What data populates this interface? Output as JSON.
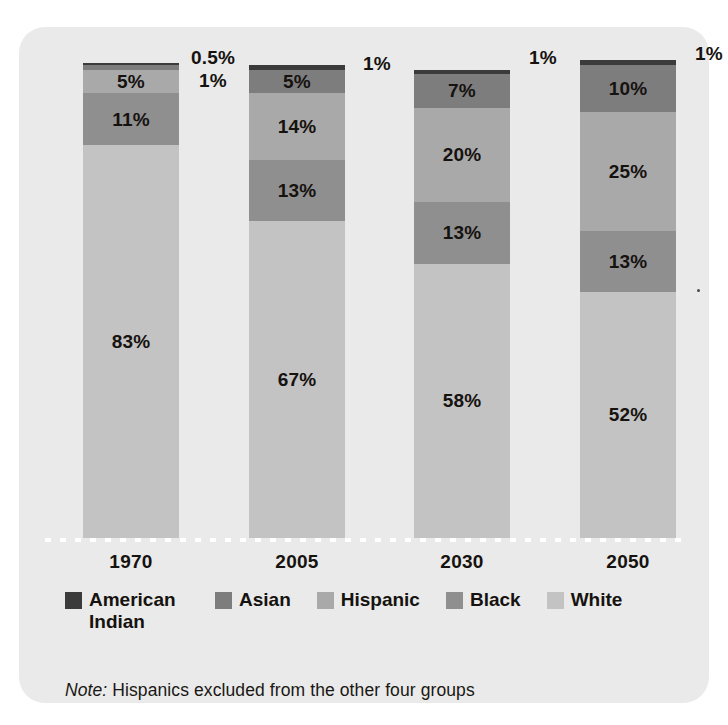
{
  "card": {
    "background": "#e9eae9"
  },
  "chart_data": {
    "type": "bar",
    "stacked": true,
    "title": "",
    "subtitle": "",
    "xlabel": "",
    "ylabel": "",
    "ylim": [
      0,
      100
    ],
    "grid": false,
    "legend_position": "bottom",
    "categories": [
      "1970",
      "2005",
      "2030",
      "2050"
    ],
    "series": [
      {
        "name": "American Indian",
        "color": "#3b3b3b",
        "values": [
          0.5,
          1,
          1,
          1
        ],
        "labels": [
          "0.5%",
          "1%",
          "1%",
          "1%"
        ],
        "label_placement": "outside-right"
      },
      {
        "name": "Asian",
        "color": "#7d7d7d",
        "values": [
          1,
          5,
          7,
          10
        ],
        "labels": [
          "1%",
          "5%",
          "7%",
          "10%"
        ],
        "label_placement": "inside"
      },
      {
        "name": "Hispanic",
        "color": "#a9a9a9",
        "values": [
          5,
          14,
          20,
          25
        ],
        "labels": [
          "5%",
          "14%",
          "20%",
          "25%"
        ],
        "label_placement": "inside"
      },
      {
        "name": "Black",
        "color": "#8f8f8f",
        "values": [
          11,
          13,
          13,
          13
        ],
        "labels": [
          "11%",
          "13%",
          "13%",
          "13%"
        ],
        "label_placement": "inside"
      },
      {
        "name": "White",
        "color": "#c3c3c3",
        "values": [
          83,
          67,
          58,
          52
        ],
        "labels": [
          "83%",
          "67%",
          "58%",
          "52%"
        ],
        "label_placement": "inside"
      }
    ],
    "notes": [
      "Note: Hispanics excluded from the other four groups"
    ]
  },
  "bars": [
    {
      "year": "1970",
      "segments": [
        {
          "group": "American Indian",
          "value": 0.5,
          "label": "",
          "color": "#3b3b3b"
        },
        {
          "group": "Asian",
          "value": 1,
          "label": "",
          "color": "#7d7d7d"
        },
        {
          "group": "Hispanic",
          "value": 5,
          "label": "5%",
          "color": "#a9a9a9"
        },
        {
          "group": "Black",
          "value": 11,
          "label": "11%",
          "color": "#8f8f8f"
        },
        {
          "group": "White",
          "value": 83,
          "label": "83%",
          "color": "#c3c3c3"
        }
      ],
      "callouts": [
        "0.5%",
        "1%"
      ]
    },
    {
      "year": "2005",
      "segments": [
        {
          "group": "American Indian",
          "value": 1,
          "label": "",
          "color": "#3b3b3b"
        },
        {
          "group": "Asian",
          "value": 5,
          "label": "5%",
          "color": "#7d7d7d"
        },
        {
          "group": "Hispanic",
          "value": 14,
          "label": "14%",
          "color": "#a9a9a9"
        },
        {
          "group": "Black",
          "value": 13,
          "label": "13%",
          "color": "#8f8f8f"
        },
        {
          "group": "White",
          "value": 67,
          "label": "67%",
          "color": "#c3c3c3"
        }
      ],
      "callouts": [
        "1%"
      ]
    },
    {
      "year": "2030",
      "segments": [
        {
          "group": "American Indian",
          "value": 1,
          "label": "",
          "color": "#3b3b3b"
        },
        {
          "group": "Asian",
          "value": 7,
          "label": "7%",
          "color": "#7d7d7d"
        },
        {
          "group": "Hispanic",
          "value": 20,
          "label": "20%",
          "color": "#a9a9a9"
        },
        {
          "group": "Black",
          "value": 13,
          "label": "13%",
          "color": "#8f8f8f"
        },
        {
          "group": "White",
          "value": 58,
          "label": "58%",
          "color": "#c3c3c3"
        }
      ],
      "callouts": [
        "1%"
      ]
    },
    {
      "year": "2050",
      "segments": [
        {
          "group": "American Indian",
          "value": 1,
          "label": "",
          "color": "#3b3b3b"
        },
        {
          "group": "Asian",
          "value": 10,
          "label": "10%",
          "color": "#7d7d7d"
        },
        {
          "group": "Hispanic",
          "value": 25,
          "label": "25%",
          "color": "#a9a9a9"
        },
        {
          "group": "Black",
          "value": 13,
          "label": "13%",
          "color": "#8f8f8f"
        },
        {
          "group": "White",
          "value": 52,
          "label": "52%",
          "color": "#c3c3c3"
        }
      ],
      "callouts": [
        "1%"
      ]
    }
  ],
  "legend": {
    "items": [
      {
        "label": "American Indian",
        "color": "#3b3b3b"
      },
      {
        "label": "Asian",
        "color": "#7d7d7d"
      },
      {
        "label": "Hispanic",
        "color": "#a9a9a9"
      },
      {
        "label": "Black",
        "color": "#8f8f8f"
      },
      {
        "label": "White",
        "color": "#c3c3c3"
      }
    ]
  },
  "note": {
    "emphasis": "Note:",
    "text": "Hispanics excluded from the other four groups"
  }
}
